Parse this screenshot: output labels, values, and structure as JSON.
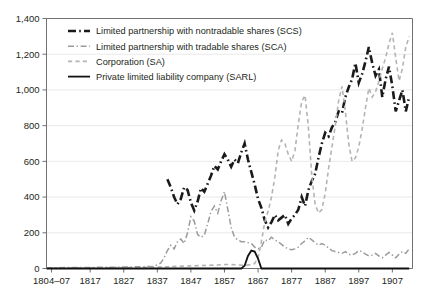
{
  "chart_data": {
    "type": "line",
    "title": "",
    "subtitle": "",
    "xlabel": "",
    "ylabel": "",
    "ylim": [
      0,
      1400
    ],
    "yticks": [
      0,
      200,
      400,
      600,
      800,
      1000,
      1200,
      1400
    ],
    "ytick_labels": [
      "0",
      "200",
      "400",
      "600",
      "800",
      "1,000",
      "1,200",
      "1,400"
    ],
    "xlim": [
      1804,
      1913
    ],
    "xticks": [
      1805.5,
      1817,
      1827,
      1837,
      1847,
      1857,
      1867,
      1877,
      1887,
      1897,
      1907
    ],
    "xtick_labels": [
      "1804–07",
      "1817",
      "1827",
      "1837",
      "1847",
      "1857",
      "1867",
      "1877",
      "1887",
      "1897",
      "1907"
    ],
    "grid": "horizontal",
    "legend_position": "top-left-inside",
    "series": [
      {
        "name": "Limited partnership with nontradable shares (SCS)",
        "key": "scs",
        "color": "#1a1a1a",
        "dash": "long-dash-dot",
        "width": 2.6,
        "x": [
          1840,
          1841,
          1842,
          1843,
          1844,
          1845,
          1846,
          1847,
          1848,
          1849,
          1850,
          1851,
          1852,
          1853,
          1854,
          1855,
          1856,
          1857,
          1858,
          1859,
          1860,
          1861,
          1862,
          1863,
          1864,
          1865,
          1866,
          1867,
          1868,
          1869,
          1870,
          1871,
          1872,
          1873,
          1874,
          1875,
          1876,
          1877,
          1878,
          1879,
          1880,
          1881,
          1882,
          1883,
          1884,
          1885,
          1886,
          1887,
          1888,
          1889,
          1890,
          1891,
          1892,
          1893,
          1894,
          1895,
          1896,
          1897,
          1898,
          1899,
          1900,
          1901,
          1902,
          1903,
          1904,
          1905,
          1906,
          1907,
          1908,
          1909,
          1910,
          1911,
          1912
        ],
        "y": [
          500,
          455,
          400,
          360,
          390,
          455,
          440,
          370,
          325,
          375,
          450,
          430,
          475,
          520,
          575,
          555,
          600,
          640,
          610,
          570,
          610,
          590,
          650,
          700,
          610,
          540,
          470,
          390,
          340,
          270,
          230,
          260,
          300,
          270,
          285,
          300,
          250,
          280,
          300,
          330,
          400,
          350,
          440,
          490,
          530,
          620,
          700,
          760,
          740,
          790,
          820,
          880,
          870,
          960,
          1015,
          1060,
          1150,
          1040,
          1090,
          1160,
          1240,
          1150,
          1080,
          1115,
          960,
          1060,
          1130,
          1020,
          880,
          940,
          1000,
          880,
          960
        ]
      },
      {
        "name": "Limited partnership with tradable shares (SCA)",
        "key": "sca",
        "color": "#9a9b9d",
        "dash": "dash-dot",
        "width": 1.5,
        "x": [
          1804,
          1810,
          1817,
          1822,
          1827,
          1832,
          1836,
          1838,
          1839,
          1840,
          1841,
          1842,
          1843,
          1844,
          1845,
          1846,
          1847,
          1848,
          1849,
          1850,
          1851,
          1852,
          1853,
          1854,
          1855,
          1856,
          1857,
          1858,
          1859,
          1860,
          1861,
          1862,
          1863,
          1864,
          1865,
          1866,
          1867,
          1868,
          1869,
          1870,
          1871,
          1872,
          1873,
          1874,
          1875,
          1876,
          1877,
          1878,
          1879,
          1880,
          1881,
          1882,
          1883,
          1884,
          1885,
          1886,
          1887,
          1888,
          1889,
          1890,
          1891,
          1892,
          1893,
          1894,
          1895,
          1896,
          1897,
          1898,
          1899,
          1900,
          1901,
          1902,
          1903,
          1904,
          1905,
          1906,
          1907,
          1908,
          1909,
          1910,
          1911,
          1912
        ],
        "y": [
          4,
          5,
          6,
          7,
          8,
          10,
          12,
          30,
          60,
          100,
          130,
          110,
          150,
          165,
          140,
          200,
          290,
          265,
          190,
          175,
          185,
          250,
          320,
          350,
          310,
          380,
          430,
          330,
          230,
          175,
          160,
          150,
          150,
          145,
          140,
          120,
          110,
          120,
          160,
          155,
          175,
          160,
          150,
          135,
          120,
          110,
          105,
          110,
          120,
          140,
          155,
          175,
          160,
          145,
          130,
          140,
          130,
          115,
          100,
          95,
          90,
          85,
          95,
          80,
          75,
          85,
          100,
          95,
          80,
          70,
          75,
          85,
          70,
          60,
          75,
          90,
          75,
          60,
          80,
          95,
          85,
          110
        ]
      },
      {
        "name": "Corporation (SA)",
        "key": "sa",
        "color": "#b3b4b6",
        "dash": "dash",
        "width": 1.6,
        "x": [
          1804,
          1812,
          1820,
          1827,
          1833,
          1837,
          1840,
          1843,
          1846,
          1849,
          1852,
          1855,
          1857,
          1859,
          1861,
          1863,
          1865,
          1866,
          1867,
          1868,
          1869,
          1870,
          1871,
          1872,
          1873,
          1874,
          1875,
          1876,
          1877,
          1878,
          1879,
          1880,
          1881,
          1882,
          1883,
          1884,
          1885,
          1886,
          1887,
          1888,
          1889,
          1890,
          1891,
          1892,
          1893,
          1894,
          1895,
          1896,
          1897,
          1898,
          1899,
          1900,
          1901,
          1902,
          1903,
          1904,
          1905,
          1906,
          1907,
          1908,
          1909,
          1910,
          1911,
          1912
        ],
        "y": [
          2,
          3,
          4,
          5,
          6,
          8,
          10,
          12,
          14,
          16,
          18,
          20,
          22,
          22,
          20,
          18,
          22,
          28,
          60,
          150,
          260,
          320,
          400,
          510,
          660,
          720,
          700,
          640,
          600,
          660,
          810,
          935,
          970,
          790,
          520,
          360,
          310,
          330,
          420,
          560,
          680,
          800,
          940,
          1020,
          880,
          700,
          600,
          620,
          680,
          780,
          900,
          1010,
          960,
          990,
          1050,
          1120,
          1180,
          1260,
          1320,
          1180,
          1050,
          1120,
          1240,
          1300
        ]
      },
      {
        "name": "Private limited liability company (SARL)",
        "key": "sarl",
        "color": "#111111",
        "dash": "solid",
        "width": 1.8,
        "x": [
          1804,
          1820,
          1840,
          1855,
          1860,
          1862,
          1863,
          1864,
          1865,
          1866,
          1867,
          1868,
          1880,
          1900,
          1912
        ],
        "y": [
          0,
          0,
          0,
          0,
          0,
          0,
          15,
          70,
          100,
          95,
          55,
          0,
          0,
          0,
          0
        ]
      }
    ]
  },
  "legend": {
    "items": [
      {
        "label": "Limited partnership with nontradable shares (SCS)",
        "key": "scs"
      },
      {
        "label": "Limited partnership with tradable shares (SCA)",
        "key": "sca"
      },
      {
        "label": "Corporation (SA)",
        "key": "sa"
      },
      {
        "label": "Private limited liability company (SARL)",
        "key": "sarl"
      }
    ]
  },
  "colors": {
    "scs": "#1a1a1a",
    "sca": "#9a9b9d",
    "sa": "#b3b4b6",
    "sarl": "#111111",
    "grid": "#e9e9ea",
    "axis": "#6f7072",
    "text": "#231f20",
    "background": "#ffffff"
  }
}
